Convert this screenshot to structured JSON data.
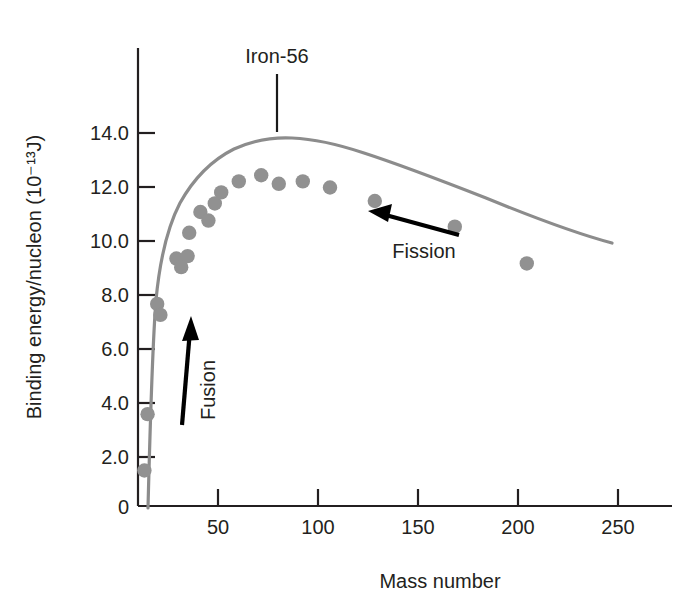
{
  "figure": {
    "background_color": "#ffffff",
    "curve_color": "#8c8c8c",
    "point_color": "#919191",
    "axis_color": "#231f20",
    "arrow_color": "#000000"
  },
  "chart_data": {
    "type": "scatter",
    "title": "",
    "subtitle": "",
    "xlabel": "Mass number",
    "ylabel": "Binding energy/nucleon (10⁻¹³J)",
    "xlim": [
      0,
      280
    ],
    "ylim": [
      0,
      15.4
    ],
    "xticks": [
      50,
      100,
      150,
      200,
      250
    ],
    "xtick_labels": [
      "50",
      "100",
      "150",
      "200",
      "250"
    ],
    "yticks": [
      0,
      2.0,
      4.0,
      6.0,
      8.0,
      10.0,
      12.0,
      14.0
    ],
    "ytick_labels": [
      "0",
      "2.0",
      "4.0",
      "6.0",
      "8.0",
      "10.0",
      "12.0",
      "14.0"
    ],
    "grid": false,
    "legend": "none",
    "points": [
      {
        "x": 4,
        "y": 1.45,
        "label": "He-4 region"
      },
      {
        "x": 6,
        "y": 3.75,
        "label": ""
      },
      {
        "x": 12,
        "y": 8.25,
        "label": ""
      },
      {
        "x": 14,
        "y": 7.8,
        "label": ""
      },
      {
        "x": 24,
        "y": 10.1,
        "label": ""
      },
      {
        "x": 27,
        "y": 9.75,
        "label": ""
      },
      {
        "x": 31,
        "y": 10.2,
        "label": ""
      },
      {
        "x": 32,
        "y": 11.15,
        "label": ""
      },
      {
        "x": 39,
        "y": 12.0,
        "label": ""
      },
      {
        "x": 44,
        "y": 11.65,
        "label": ""
      },
      {
        "x": 48,
        "y": 12.35,
        "label": ""
      },
      {
        "x": 52,
        "y": 12.8,
        "label": ""
      },
      {
        "x": 63,
        "y": 13.25,
        "label": ""
      },
      {
        "x": 77,
        "y": 13.5,
        "label": "Iron-56 peak marker"
      },
      {
        "x": 88,
        "y": 13.15,
        "label": ""
      },
      {
        "x": 103,
        "y": 13.25,
        "label": ""
      },
      {
        "x": 120,
        "y": 13.0,
        "label": ""
      },
      {
        "x": 148,
        "y": 12.45,
        "label": ""
      },
      {
        "x": 198,
        "y": 11.4,
        "label": ""
      },
      {
        "x": 243,
        "y": 9.9,
        "label": ""
      }
    ],
    "curve": {
      "description": "smooth binding-energy-per-nucleon curve rising steeply from low mass number, peaking near mass number 60-80 at about 13.5, then falling gradually to about 9.8 at mass number 250",
      "peak_x": 70,
      "peak_y": 13.45,
      "start_x": 2,
      "start_y": 0.2,
      "end_x": 258,
      "end_y": 9.8
    }
  },
  "annotations": {
    "iron_label": "Iron-56",
    "fusion_label": "Fusion",
    "fission_label": "Fission"
  }
}
